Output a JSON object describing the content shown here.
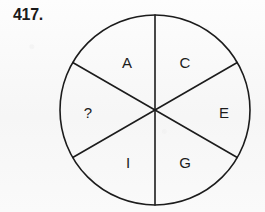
{
  "page": {
    "background_color": "#fbfbfb",
    "ink_color": "#1c1c1c"
  },
  "question": {
    "number_label": "417."
  },
  "figure": {
    "name": "six-sector-circle",
    "center_x": 155,
    "center_y": 110,
    "radius": 95,
    "stroke_width": 1.6,
    "sector_count": 6,
    "sector_degrees": 60,
    "dividers": [
      {
        "name": "vertical-diameter",
        "angle_deg": 90
      },
      {
        "name": "diagonal-diameter-upper-left",
        "angle_deg": 150
      },
      {
        "name": "diagonal-diameter-upper-right",
        "angle_deg": 30
      }
    ],
    "sectors": [
      {
        "name": "sector-a",
        "label": "A",
        "x": 127,
        "y": 62
      },
      {
        "name": "sector-c",
        "label": "C",
        "x": 185,
        "y": 62
      },
      {
        "name": "sector-e",
        "label": "E",
        "x": 224,
        "y": 112
      },
      {
        "name": "sector-g",
        "label": "G",
        "x": 185,
        "y": 162
      },
      {
        "name": "sector-i",
        "label": "I",
        "x": 128,
        "y": 162
      },
      {
        "name": "sector-unknown",
        "label": "?",
        "x": 88,
        "y": 112
      }
    ]
  }
}
